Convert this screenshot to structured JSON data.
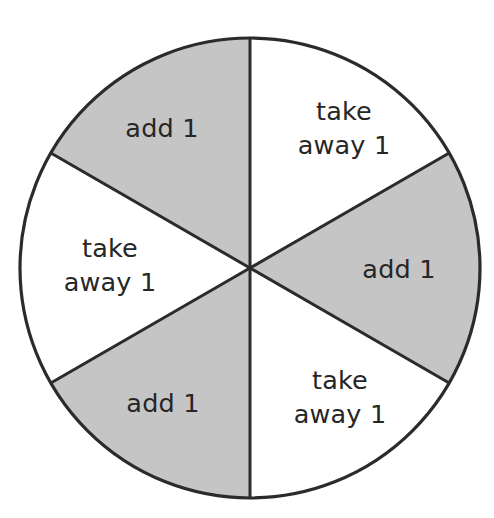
{
  "figure": {
    "name": "spinner-wheel",
    "background_color": "#ffffff"
  },
  "wheel": {
    "center_x": 250,
    "center_y": 268,
    "radius": 230,
    "outline_color": "#2b2b2b",
    "outline_width": 3.2,
    "divider_color": "#2b2b2b",
    "divider_width": 3.0,
    "section_count": 6,
    "section_angle_degrees": 60,
    "fill_white": "#ffffff",
    "fill_gray": "#c5c5c5",
    "text_color": "#262626"
  },
  "chart_data": {
    "type": "pie",
    "categories": [
      "take away 1",
      "add 1",
      "take away 1",
      "add 1",
      "take away 1",
      "add 1"
    ],
    "values": [
      1,
      1,
      1,
      1,
      1,
      1
    ],
    "colors": [
      "#ffffff",
      "#c5c5c5",
      "#ffffff",
      "#c5c5c5",
      "#ffffff",
      "#c5c5c5"
    ],
    "legend": "none",
    "grid": false,
    "start_angle_degrees": 90,
    "direction": "clockwise",
    "outcome_counts": {
      "add 1": 3,
      "take away 1": 3
    }
  },
  "sections": [
    {
      "id": "section-top-right",
      "label": "take away 1",
      "lines": [
        "take",
        "away 1"
      ],
      "fill": "#ffffff",
      "start_angle": 90,
      "end_angle": 30,
      "label_x": 344,
      "label_y": 120
    },
    {
      "id": "section-right",
      "label": "add 1",
      "lines": [
        "add 1"
      ],
      "fill": "#c5c5c5",
      "start_angle": 30,
      "end_angle": -30,
      "label_x": 399,
      "label_y": 278
    },
    {
      "id": "section-bottom-right",
      "label": "take away 1",
      "lines": [
        "take",
        "away 1"
      ],
      "fill": "#ffffff",
      "start_angle": -30,
      "end_angle": -90,
      "label_x": 340,
      "label_y": 389
    },
    {
      "id": "section-bottom-left",
      "label": "add 1",
      "lines": [
        "add 1"
      ],
      "fill": "#c5c5c5",
      "start_angle": -90,
      "end_angle": -150,
      "label_x": 163,
      "label_y": 412
    },
    {
      "id": "section-left",
      "label": "take away 1",
      "lines": [
        "take",
        "away 1"
      ],
      "fill": "#ffffff",
      "start_angle": -150,
      "end_angle": 150,
      "label_x": 110,
      "label_y": 257
    },
    {
      "id": "section-top-left",
      "label": "add 1",
      "lines": [
        "add 1"
      ],
      "fill": "#c5c5c5",
      "start_angle": 150,
      "end_angle": 90,
      "label_x": 162,
      "label_y": 137
    }
  ]
}
